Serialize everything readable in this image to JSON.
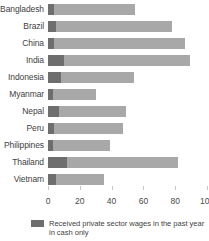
{
  "chart_data": {
    "type": "bar",
    "orientation": "horizontal",
    "stacked": true,
    "title": "",
    "xlabel": "",
    "ylabel": "",
    "xlim": [
      0,
      100
    ],
    "ylim": null,
    "grid": false,
    "legend_position": "bottom-left",
    "categories": [
      "Bangladesh",
      "Brazil",
      "China",
      "India",
      "Indonesia",
      "Myanmar",
      "Nepal",
      "Peru",
      "Philippines",
      "Thailand",
      "Vietnam"
    ],
    "xticks": [
      0,
      20,
      40,
      60,
      80,
      100
    ],
    "xtick_labels": [
      "0",
      "20",
      "40",
      "60",
      "80",
      "100"
    ],
    "series": [
      {
        "name": "Received private sector wages in the past year in cash only",
        "color": "#6e6e6e",
        "values": [
          4,
          5,
          4,
          10,
          8,
          3,
          7,
          4,
          3,
          12,
          5
        ]
      },
      {
        "name": "",
        "color": "#a8a8a8",
        "values": [
          51,
          73,
          82,
          79,
          46,
          27,
          42,
          43,
          36,
          70,
          30
        ]
      }
    ],
    "totals": [
      55,
      78,
      86,
      89,
      54,
      30,
      49,
      47,
      39,
      82,
      35
    ]
  },
  "legend": {
    "items": [
      {
        "swatch_color": "#6e6e6e",
        "label": "Received private sector wages in the past year in cash only"
      }
    ]
  },
  "colors": {
    "cash_only": "#6e6e6e",
    "other": "#a8a8a8",
    "text": "#3f3f3f",
    "tick": "#c9c9c9",
    "background": "#ffffff"
  }
}
